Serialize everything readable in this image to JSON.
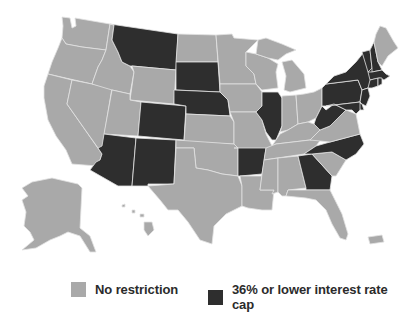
{
  "map": {
    "title": "US states interest rate cap map",
    "colors": {
      "none": "#a9a9a9",
      "cap": "#2e2e2e",
      "border": "#e2e2e2"
    },
    "categories": {
      "none": "No restriction",
      "cap": "36% or lower interest rate cap"
    },
    "states_with_cap": [
      "MT",
      "SD",
      "NE",
      "CO",
      "AZ",
      "NM",
      "AR",
      "IL",
      "GA",
      "NC",
      "WV",
      "PA",
      "NY",
      "VT",
      "NH",
      "MA",
      "CT",
      "RI",
      "NJ",
      "MD",
      "DE",
      "DC"
    ],
    "states_no_restriction": [
      "WA",
      "OR",
      "CA",
      "NV",
      "ID",
      "UT",
      "WY",
      "ND",
      "MN",
      "IA",
      "KS",
      "OK",
      "TX",
      "MO",
      "LA",
      "WI",
      "MI",
      "IN",
      "OH",
      "KY",
      "TN",
      "MS",
      "AL",
      "FL",
      "SC",
      "VA",
      "ME",
      "AK",
      "HI",
      "PR"
    ]
  },
  "legend": {
    "items": [
      {
        "key": "none",
        "label": "No restriction",
        "color": "#a9a9a9"
      },
      {
        "key": "cap",
        "label": "36% or lower interest rate cap",
        "color": "#2e2e2e"
      }
    ]
  }
}
